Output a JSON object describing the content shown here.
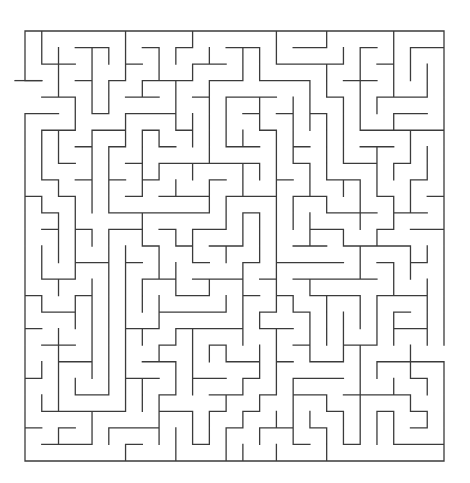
{
  "page": {
    "width": 470,
    "height": 483,
    "background": "#ffffff"
  },
  "maze": {
    "kind": "orthogonal-grid-maze",
    "cols": 25,
    "rows": 26,
    "left": 25.0,
    "top": 31.0,
    "cell_width": 16.76,
    "cell_height": 16.538,
    "wall_color": "#3b3b3b",
    "wall_width": 1.3,
    "background": "#ffffff",
    "seed": 1337,
    "entrance": {
      "side": "left",
      "row": 3,
      "span": 2
    },
    "exit": {
      "side": "right",
      "row": 19,
      "span": 1
    },
    "entrance_marker": {
      "x1": 15.0,
      "y1": 80.61,
      "x2": 41.76,
      "y2": 80.61
    }
  }
}
